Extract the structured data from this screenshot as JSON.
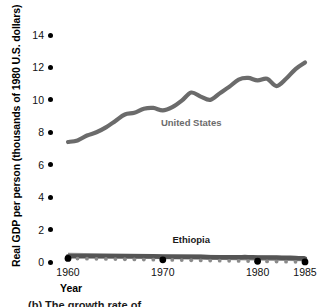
{
  "chart_data": {
    "type": "line",
    "title": "",
    "xlabel": "Year",
    "ylabel": "Real GDP per person (thousands of 1980 U.S. dollars)",
    "xlim": [
      1960,
      1985
    ],
    "ylim": [
      0,
      14
    ],
    "yticks": [
      14,
      12,
      10,
      8,
      6,
      4,
      2,
      0
    ],
    "ytick_labels": [
      "14",
      "12",
      "10",
      "8",
      "6",
      "4",
      "2",
      "0"
    ],
    "xticks": [
      1960,
      1970,
      1980,
      1985
    ],
    "xtick_labels": [
      "1960",
      "1970",
      "1980",
      "1985"
    ],
    "grid": false,
    "legend": "inline-labels",
    "x": [
      1960,
      1961,
      1962,
      1963,
      1964,
      1965,
      1966,
      1967,
      1968,
      1969,
      1970,
      1971,
      1972,
      1973,
      1974,
      1975,
      1976,
      1977,
      1978,
      1979,
      1980,
      1981,
      1982,
      1983,
      1984,
      1985
    ],
    "series": [
      {
        "name": "United States",
        "color": "#6b6b6b",
        "label_x": 1973,
        "label_y": 8.55,
        "values": [
          7.4,
          7.5,
          7.8,
          8.0,
          8.3,
          8.7,
          9.1,
          9.2,
          9.45,
          9.5,
          9.35,
          9.55,
          9.95,
          10.45,
          10.2,
          10.0,
          10.4,
          10.8,
          11.25,
          11.35,
          11.2,
          11.3,
          10.85,
          11.3,
          11.9,
          12.3
        ]
      },
      {
        "name": "Ethiopia",
        "color": "#555555",
        "label_x": 1973,
        "label_y": 1.35,
        "values": [
          0.35,
          0.35,
          0.35,
          0.35,
          0.35,
          0.35,
          0.35,
          0.35,
          0.35,
          0.35,
          0.33,
          0.33,
          0.33,
          0.32,
          0.32,
          0.3,
          0.3,
          0.3,
          0.3,
          0.3,
          0.28,
          0.28,
          0.28,
          0.26,
          0.25,
          0.22
        ]
      }
    ],
    "axis_markers": {
      "major_years": [
        1960,
        1970,
        1980,
        1985
      ],
      "minor_years": [
        1961,
        1962,
        1963,
        1964,
        1965,
        1966,
        1967,
        1968,
        1969,
        1971,
        1972,
        1973,
        1974,
        1975,
        1976,
        1977,
        1978,
        1979,
        1981,
        1982,
        1983,
        1984
      ],
      "major_color": "#000000",
      "minor_color": "#8a8a8a"
    }
  },
  "caption": {
    "text": "(b) The growth rate of … …"
  }
}
